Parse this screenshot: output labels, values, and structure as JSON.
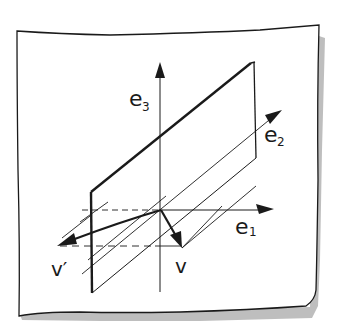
{
  "diagram": {
    "colors": {
      "background": "#ffffff",
      "paper": "#ffffff",
      "ink": "#1a1a1a",
      "shadow": "#9a9a9a"
    },
    "axes": [
      {
        "id": "e1",
        "base": "e",
        "subscript": "1",
        "direction": "right"
      },
      {
        "id": "e2",
        "base": "e",
        "subscript": "2",
        "direction": "up-right (depth)"
      },
      {
        "id": "e3",
        "base": "e",
        "subscript": "3",
        "direction": "up"
      }
    ],
    "vectors": [
      {
        "id": "v",
        "label": "v",
        "description": "original vector pointing down-right from origin"
      },
      {
        "id": "v_prime",
        "label": "v′",
        "description": "reflected vector pointing left from origin"
      }
    ],
    "plane": {
      "description": "parallelogram plane containing e2 direction, tilted, with hatched guide lines"
    }
  }
}
